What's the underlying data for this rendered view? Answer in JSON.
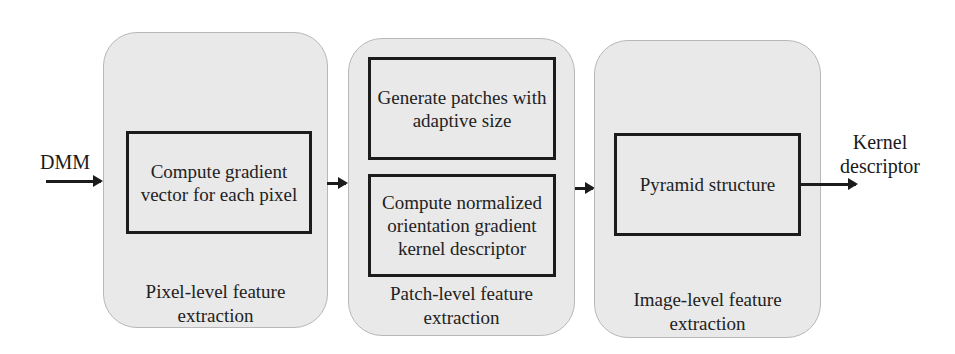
{
  "diagram": {
    "input_label": "DMM",
    "output_label": "Kernel descriptor",
    "output_label_lines": [
      "Kernel",
      "descriptor"
    ],
    "stages": [
      {
        "caption": "Pixel-level feature extraction",
        "caption_lines": [
          "Pixel-level feature",
          "extraction"
        ],
        "boxes": [
          {
            "label": "Compute gradient vector for each pixel"
          }
        ]
      },
      {
        "caption": "Patch-level feature extraction",
        "caption_lines": [
          "Patch-level feature",
          "extraction"
        ],
        "boxes": [
          {
            "label": "Generate patches with adaptive size"
          },
          {
            "label": "Compute normalized orientation gradient kernel descriptor"
          }
        ]
      },
      {
        "caption": "Image-level feature extraction",
        "caption_lines": [
          "Image-level feature",
          "extraction"
        ],
        "boxes": [
          {
            "label": "Pyramid structure"
          }
        ]
      }
    ],
    "colors": {
      "panel_fill": "#e9e9e9",
      "box_border": "#1c1c1c",
      "arrow": "#1c1c1c",
      "background": "#ffffff"
    }
  }
}
